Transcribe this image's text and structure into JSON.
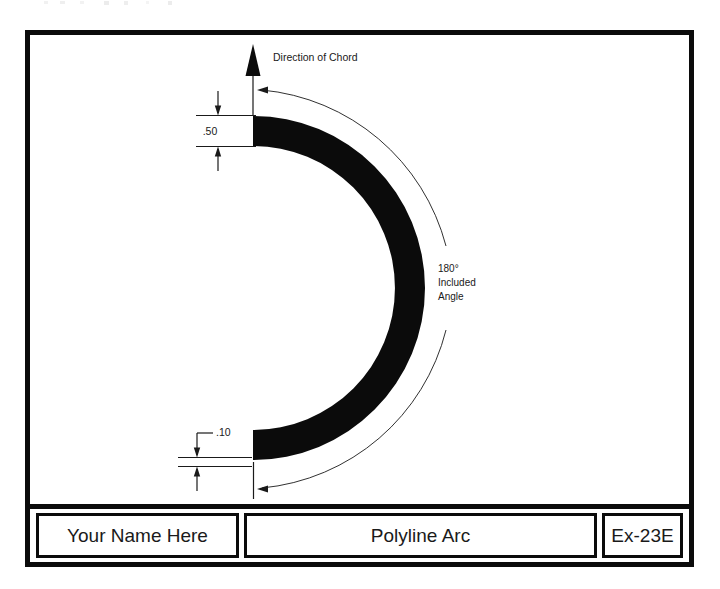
{
  "document": {
    "type": "technical-drawing",
    "sheet_background": "#ffffff",
    "ink_color": "#0b0b0b"
  },
  "drawing": {
    "annotations": {
      "direction_of_chord": "Direction of Chord",
      "included_angle_line1": "180°",
      "included_angle_line2": "Included",
      "included_angle_line3": "Angle",
      "dimension_width": ".50",
      "dimension_gap": ".10"
    },
    "geometry": {
      "arc_sweep_degrees": 180,
      "band_width_value": ".50",
      "end_gap_value": ".10",
      "chord_direction": "up"
    }
  },
  "title_block": {
    "name_field": "Your Name Here",
    "title_field": "Polyline Arc",
    "exercise_field": "Ex-23E"
  }
}
